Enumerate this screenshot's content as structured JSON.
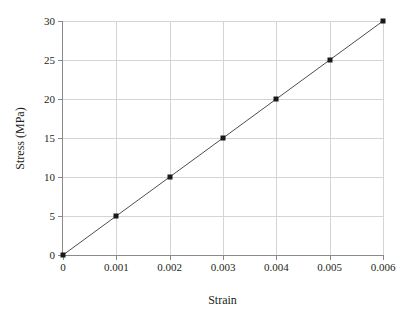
{
  "chart_data": {
    "type": "line",
    "title": "",
    "xlabel": "Strain",
    "ylabel": "Stress (MPa)",
    "x": [
      0,
      0.001,
      0.002,
      0.003,
      0.004,
      0.005,
      0.006
    ],
    "values": [
      0,
      5,
      10,
      15,
      20,
      25,
      30
    ],
    "series": [
      {
        "name": "Stress vs Strain",
        "x": [
          0,
          0.001,
          0.002,
          0.003,
          0.004,
          0.005,
          0.006
        ],
        "values": [
          0,
          5,
          10,
          15,
          20,
          25,
          30
        ]
      }
    ],
    "xlim": [
      0,
      0.006
    ],
    "ylim": [
      0,
      30
    ],
    "xticks": [
      0,
      0.001,
      0.002,
      0.003,
      0.004,
      0.005,
      0.006
    ],
    "yticks": [
      0,
      5,
      10,
      15,
      20,
      25,
      30
    ],
    "xtick_labels": [
      "0",
      "0.001",
      "0.002",
      "0.003",
      "0.004",
      "0.005",
      "0.006"
    ],
    "ytick_labels": [
      "0",
      "5",
      "10",
      "15",
      "20",
      "25",
      "30"
    ],
    "grid": true,
    "legend": false,
    "legend_position": "none",
    "marker": "square",
    "line_color": "#4d4d4d",
    "marker_color": "#1a1a1a",
    "grid_color": "#d4d4d4",
    "axis_color": "#8a8a8a",
    "background": "#ffffff"
  }
}
